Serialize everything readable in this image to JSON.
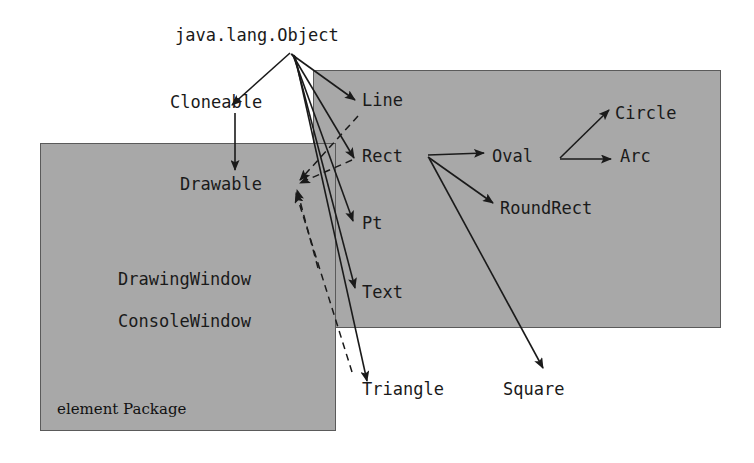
{
  "diagram": {
    "background_color": "#ffffff",
    "package_fill_color": "#a8a8a8",
    "package_border_color": "#5a5a5a",
    "line_color": "#1a1a1a",
    "text_color": "#1a1a1a"
  },
  "packages": [
    {
      "id": "pkg-right",
      "caption": "",
      "x": 313,
      "y": 70,
      "width": 408,
      "height": 258
    },
    {
      "id": "pkg-left",
      "caption": "element Package",
      "x": 40,
      "y": 143,
      "width": 296,
      "height": 288
    }
  ],
  "nodes": [
    {
      "id": "object",
      "label": "java.lang.Object",
      "x": 175,
      "y": 27,
      "font": "mono"
    },
    {
      "id": "cloneable",
      "label": "Cloneable",
      "x": 170,
      "y": 94,
      "font": "mono"
    },
    {
      "id": "drawable",
      "label": "Drawable",
      "x": 180,
      "y": 176,
      "font": "mono"
    },
    {
      "id": "drawingwindow",
      "label": "DrawingWindow",
      "x": 118,
      "y": 271,
      "font": "mono"
    },
    {
      "id": "consolewindow",
      "label": "ConsoleWindow",
      "x": 118,
      "y": 313,
      "font": "mono"
    },
    {
      "id": "line",
      "label": "Line",
      "x": 362,
      "y": 92,
      "font": "mono"
    },
    {
      "id": "rect",
      "label": "Rect",
      "x": 362,
      "y": 148,
      "font": "mono"
    },
    {
      "id": "pt",
      "label": "Pt",
      "x": 362,
      "y": 215,
      "font": "mono"
    },
    {
      "id": "text",
      "label": "Text",
      "x": 362,
      "y": 284,
      "font": "mono"
    },
    {
      "id": "oval",
      "label": "Oval",
      "x": 492,
      "y": 148,
      "font": "mono"
    },
    {
      "id": "roundrect",
      "label": "RoundRect",
      "x": 500,
      "y": 200,
      "font": "mono"
    },
    {
      "id": "circle",
      "label": "Circle",
      "x": 615,
      "y": 105,
      "font": "mono"
    },
    {
      "id": "arc",
      "label": "Arc",
      "x": 620,
      "y": 148,
      "font": "mono"
    },
    {
      "id": "triangle",
      "label": "Triangle",
      "x": 362,
      "y": 381,
      "font": "mono"
    },
    {
      "id": "square",
      "label": "Square",
      "x": 503,
      "y": 381,
      "font": "mono"
    }
  ],
  "edges": [
    {
      "from": "object",
      "to": "cloneable",
      "style": "solid",
      "kind": "inheritance",
      "path": "M 290,53 L 232,105"
    },
    {
      "from": "object",
      "to": "line",
      "style": "solid",
      "kind": "inheritance",
      "path": "M 291,54 L 355,100"
    },
    {
      "from": "object",
      "to": "rect",
      "style": "solid",
      "kind": "inheritance",
      "path": "M 292,54 L 354,158"
    },
    {
      "from": "object",
      "to": "pt",
      "style": "solid",
      "kind": "inheritance",
      "path": "M 293,55 L 353,221"
    },
    {
      "from": "object",
      "to": "text",
      "style": "solid",
      "kind": "inheritance",
      "path": "M 294,55 L 355,288"
    },
    {
      "from": "object",
      "to": "triangle",
      "style": "solid",
      "kind": "inheritance",
      "path": "M 295,56 L 367,381"
    },
    {
      "from": "cloneable",
      "to": "drawable",
      "style": "solid",
      "kind": "inheritance",
      "path": "M 235,113 L 235,170"
    },
    {
      "from": "line",
      "to": "drawable",
      "style": "dashed",
      "kind": "implements",
      "path": "M 358,116 L 300,180"
    },
    {
      "from": "rect",
      "to": "drawable",
      "style": "dashed",
      "kind": "implements",
      "path": "M 352,160 L 300,183"
    },
    {
      "from": "text",
      "to": "drawable",
      "style": "dashed",
      "kind": "implements",
      "path": "M 318,268 L 297,190"
    },
    {
      "from": "triangle",
      "to": "drawable",
      "style": "dashed",
      "kind": "implements",
      "path": "M 352,372 L 296,193"
    },
    {
      "from": "rect",
      "to": "oval",
      "style": "solid",
      "kind": "inheritance",
      "path": "M 428,155 L 484,153"
    },
    {
      "from": "rect",
      "to": "roundrect",
      "style": "solid",
      "kind": "inheritance",
      "path": "M 428,157 L 493,203"
    },
    {
      "from": "rect",
      "to": "square",
      "style": "solid",
      "kind": "inheritance",
      "path": "M 429,158 L 543,368"
    },
    {
      "from": "oval",
      "to": "circle",
      "style": "solid",
      "kind": "inheritance",
      "path": "M 560,158 L 609,110"
    },
    {
      "from": "oval",
      "to": "arc",
      "style": "solid",
      "kind": "inheritance",
      "path": "M 560,159 L 611,159"
    }
  ]
}
